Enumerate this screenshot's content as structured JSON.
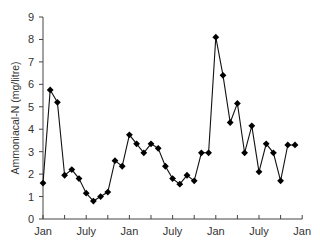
{
  "chart_data": {
    "type": "line",
    "title": "",
    "xlabel": "",
    "ylabel": "Ammoniacal-N (mg/litre)",
    "ylim": [
      0,
      9
    ],
    "yticks": [
      0,
      1,
      2,
      3,
      4,
      5,
      6,
      7,
      8,
      9
    ],
    "xtick_labels": [
      {
        "label": "Jan",
        "month": 0
      },
      {
        "label": "July",
        "month": 6
      },
      {
        "label": "Jan",
        "month": 12
      },
      {
        "label": "July",
        "month": 18
      },
      {
        "label": "Jan",
        "month": 24
      },
      {
        "label": "July",
        "month": 30
      },
      {
        "label": "Jan",
        "month": 36
      }
    ],
    "minor_tick_months": [
      0,
      3,
      6,
      9,
      12,
      15,
      18,
      21,
      24,
      27,
      30,
      33,
      36
    ],
    "grid": false,
    "legend": null,
    "marker": "diamond",
    "series": [
      {
        "name": "Ammoniacal-N",
        "x": [
          0,
          1,
          2,
          3,
          4,
          5,
          6,
          7,
          8,
          9,
          10,
          11,
          12,
          13,
          14,
          15,
          16,
          17,
          18,
          19,
          20,
          21,
          22,
          23,
          24,
          25,
          26,
          27,
          28,
          29,
          30,
          31,
          32,
          33,
          34,
          35
        ],
        "values": [
          1.6,
          5.75,
          5.2,
          1.95,
          2.2,
          1.8,
          1.15,
          0.8,
          1.0,
          1.2,
          2.6,
          2.35,
          3.75,
          3.35,
          2.95,
          3.35,
          3.15,
          2.35,
          1.8,
          1.55,
          1.95,
          1.7,
          2.95,
          2.95,
          8.1,
          6.4,
          4.3,
          5.15,
          2.95,
          4.15,
          2.1,
          3.35,
          2.95,
          1.7,
          3.3,
          3.3
        ]
      }
    ]
  }
}
